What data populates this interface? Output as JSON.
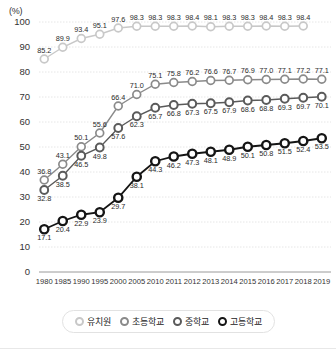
{
  "chart_data": {
    "type": "line",
    "title": "",
    "subtitle": "",
    "xlabel": "",
    "ylabel": "",
    "yunit": "(%)",
    "ylim": [
      0,
      100
    ],
    "ytick_step": 10,
    "yticks": [
      "0",
      "10",
      "20",
      "30",
      "40",
      "50",
      "60",
      "70",
      "80",
      "90",
      "100"
    ],
    "grid": true,
    "legend_position": "bottom",
    "categories": [
      "1980",
      "1985",
      "1990",
      "1995",
      "2000",
      "2005",
      "2010",
      "2011",
      "2012",
      "2013",
      "2014",
      "2015",
      "2016",
      "2017",
      "2018",
      "2019"
    ],
    "series": [
      {
        "name": "유치원",
        "color": "#c8c8c8",
        "marker": "circle-open-light",
        "values": [
          85.2,
          89.9,
          93.4,
          95.1,
          97.6,
          98.3,
          98.3,
          98.3,
          98.4,
          98.1,
          98.3,
          98.3,
          98.4,
          98.3,
          98.4,
          null
        ],
        "labels": [
          "85.2",
          "89.9",
          "93.4",
          "95.1",
          "97.6",
          "98.3",
          "98.3",
          "98.3",
          "98.4",
          "98.1",
          "98.3",
          "98.3",
          "98.4",
          "98.3",
          "98.4",
          ""
        ]
      },
      {
        "name": "초등학교",
        "color": "#8a8a8a",
        "marker": "circle-open",
        "values": [
          36.8,
          43.1,
          50.1,
          55.6,
          66.4,
          71.0,
          75.1,
          75.8,
          76.2,
          76.6,
          76.7,
          76.9,
          77.0,
          77.1,
          77.2,
          77.1
        ],
        "labels": [
          "36.8",
          "43.1",
          "50.1",
          "55.6",
          "66.4",
          "71.0",
          "75.1",
          "75.8",
          "76.2",
          "76.6",
          "76.7",
          "76.9",
          "77.0",
          "77.1",
          "77.2",
          "77.1"
        ]
      },
      {
        "name": "중학교",
        "color": "#5a5a5a",
        "marker": "circle-gray",
        "values": [
          32.8,
          38.5,
          46.5,
          49.8,
          57.6,
          62.3,
          65.7,
          66.8,
          67.3,
          67.5,
          67.9,
          68.6,
          68.8,
          69.3,
          69.7,
          70.1
        ],
        "labels": [
          "32.8",
          "38.5",
          "46.5",
          "49.8",
          "57.6",
          "62.3",
          "65.7",
          "66.8",
          "67.3",
          "67.5",
          "67.9",
          "68.6",
          "68.8",
          "69.3",
          "69.7",
          "70.1"
        ]
      },
      {
        "name": "고등학교",
        "color": "#151515",
        "marker": "circle-black",
        "values": [
          17.1,
          20.4,
          22.9,
          23.9,
          29.7,
          38.1,
          44.3,
          46.2,
          47.3,
          48.1,
          48.9,
          50.1,
          50.8,
          51.5,
          52.4,
          53.5
        ],
        "labels": [
          "17.1",
          "20.4",
          "22.9",
          "23.9",
          "29.7",
          "38.1",
          "44.3",
          "46.2",
          "47.3",
          "48.1",
          "48.9",
          "50.1",
          "50.8",
          "51.5",
          "52.4",
          "53.5"
        ]
      }
    ]
  },
  "legend": {
    "items": [
      {
        "label": "유치원"
      },
      {
        "label": "초등학교"
      },
      {
        "label": "중학교"
      },
      {
        "label": "고등학교"
      }
    ]
  }
}
